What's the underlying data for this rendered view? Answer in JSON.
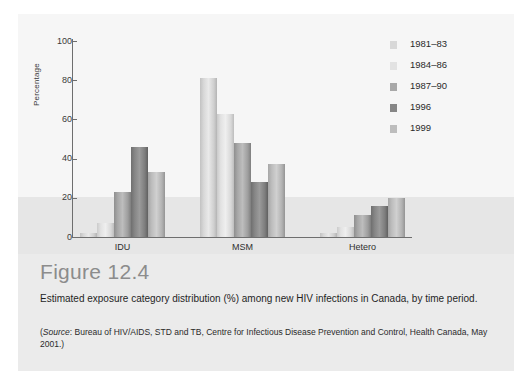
{
  "figure": {
    "number_label": "Figure 12.4",
    "description": "Estimated exposure category distribution (%) among new HIV infections in Canada, by time period.",
    "source_prefix": "(",
    "source_italic": "Source",
    "source_text": ": Bureau of HIV/AIDS, STD and TB, Centre for Infectious Disease Prevention and Control, Health Canada, May 2001.)"
  },
  "chart_data": {
    "type": "bar",
    "title": "",
    "xlabel": "",
    "ylabel": "Percentage",
    "ylim": [
      0,
      100
    ],
    "yticks": [
      0,
      20,
      40,
      60,
      80,
      100
    ],
    "ytick_labels": [
      "0",
      "20",
      "40",
      "60",
      "80",
      "100"
    ],
    "grid": false,
    "legend_position": "top-right",
    "categories": [
      "IDU",
      "MSM",
      "Hetero"
    ],
    "series": [
      {
        "name": "1981–83",
        "color": "#d8d8d8",
        "values": [
          2,
          81,
          2
        ]
      },
      {
        "name": "1984–86",
        "color": "#e2e2e2",
        "values": [
          7,
          63,
          5
        ]
      },
      {
        "name": "1987–90",
        "color": "#a8a8a8",
        "values": [
          23,
          48,
          11
        ]
      },
      {
        "name": "1996",
        "color": "#868686",
        "values": [
          46,
          28,
          16
        ]
      },
      {
        "name": "1999",
        "color": "#bdbdbd",
        "values": [
          33,
          37,
          20
        ]
      }
    ]
  },
  "colors": {
    "card_background": "#ebebeb",
    "plot_upper_band": "#f6f6f6",
    "plot_lower_band": "#e6e6e6",
    "axis": "#6e6e6e",
    "figure_number": "#8c8c8c"
  }
}
